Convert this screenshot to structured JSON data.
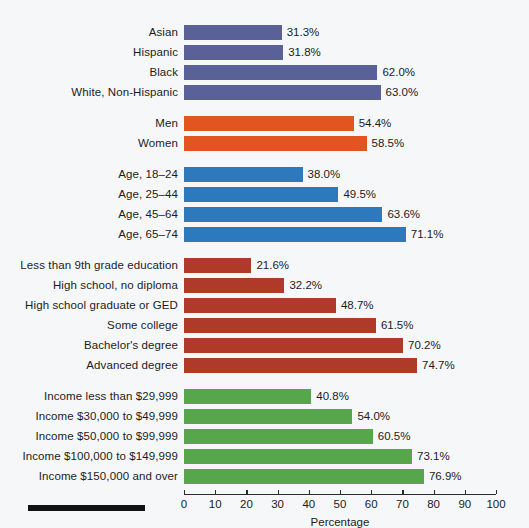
{
  "chart_data": {
    "type": "bar",
    "orientation": "horizontal",
    "title": "",
    "xlabel": "Percentage",
    "ylabel": "",
    "xlim": [
      0,
      100
    ],
    "grid": false,
    "legend": "none",
    "tick_labels": [
      "0",
      "10",
      "20",
      "30",
      "40",
      "50",
      "60",
      "70",
      "80",
      "90",
      "100"
    ],
    "ticks": [
      0,
      10,
      20,
      30,
      40,
      50,
      60,
      70,
      80,
      90,
      100
    ],
    "value_suffix": "%",
    "groups": [
      {
        "name": "race-ethnicity",
        "color": "#5a6198",
        "categories": [
          "Asian",
          "Hispanic",
          "Black",
          "White, Non-Hispanic"
        ],
        "values": [
          31.3,
          31.8,
          62.0,
          63.0
        ],
        "value_labels": [
          "31.3%",
          "31.8%",
          "62.0%",
          "63.0%"
        ]
      },
      {
        "name": "sex",
        "color": "#e25520",
        "categories": [
          "Men",
          "Women"
        ],
        "values": [
          54.4,
          58.5
        ],
        "value_labels": [
          "54.4%",
          "58.5%"
        ]
      },
      {
        "name": "age",
        "color": "#2c79be",
        "categories": [
          "Age, 18–24",
          "Age, 25–44",
          "Age, 45–64",
          "Age, 65–74"
        ],
        "values": [
          38.0,
          49.5,
          63.6,
          71.1
        ],
        "value_labels": [
          "38.0%",
          "49.5%",
          "63.6%",
          "71.1%"
        ]
      },
      {
        "name": "education",
        "color": "#b03a29",
        "categories": [
          "Less than 9th grade education",
          "High school, no diploma",
          "High school graduate or GED",
          "Some college",
          "Bachelor's degree",
          "Advanced degree"
        ],
        "values": [
          21.6,
          32.2,
          48.7,
          61.5,
          70.2,
          74.7
        ],
        "value_labels": [
          "21.6%",
          "32.2%",
          "48.7%",
          "61.5%",
          "70.2%",
          "74.7%"
        ]
      },
      {
        "name": "income",
        "color": "#58a64b",
        "categories": [
          "Income less than $29,999",
          "Income $30,000 to $49,999",
          "Income $50,000 to $99,999",
          "Income $100,000 to $149,999",
          "Income $150,000 and over"
        ],
        "values": [
          40.8,
          54.0,
          60.5,
          73.1,
          76.9
        ],
        "value_labels": [
          "40.8%",
          "54.0%",
          "60.5%",
          "73.1%",
          "76.9%"
        ]
      }
    ]
  }
}
